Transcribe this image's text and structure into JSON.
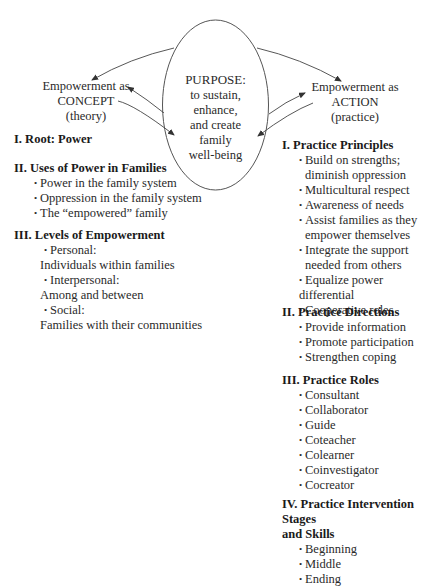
{
  "diagram": {
    "purpose": {
      "title": "PURPOSE:",
      "lines": [
        "to sustain,",
        "enhance,",
        "and create",
        "family",
        "well-being"
      ]
    },
    "concept": {
      "lines": [
        "Empowerment as",
        "CONCEPT",
        "(theory)"
      ]
    },
    "action": {
      "lines": [
        "Empowerment as",
        "ACTION",
        "(practice)"
      ]
    }
  },
  "left_column": {
    "sections": [
      {
        "heading": "I. Root: Power",
        "items": []
      },
      {
        "heading": "II. Uses of Power in Families",
        "items": [
          {
            "text": "Power in the family system"
          },
          {
            "text": "Oppression in the family system"
          },
          {
            "text": "The “empowered” family"
          }
        ]
      },
      {
        "heading": "III. Levels of Empowerment",
        "items": [
          {
            "text": "Personal:",
            "sub": "Individuals within families"
          },
          {
            "text": "Interpersonal:",
            "sub": "Among and between"
          },
          {
            "text": "Social:",
            "sub": "Families with their communities"
          }
        ]
      }
    ]
  },
  "right_column": {
    "sections": [
      {
        "heading": "I. Practice Principles",
        "items": [
          {
            "text": "Build on strengths;",
            "sub": "diminish oppression"
          },
          {
            "text": "Multicultural respect"
          },
          {
            "text": "Awareness of needs"
          },
          {
            "text": "Assist families as they",
            "sub": "empower themselves"
          },
          {
            "text": "Integrate the support",
            "sub": "needed from others"
          },
          {
            "text": "Equalize power differential"
          },
          {
            "text": "Cooperative roles"
          }
        ]
      },
      {
        "heading": "II. Practice Directions",
        "items": [
          {
            "text": "Provide information"
          },
          {
            "text": "Promote participation"
          },
          {
            "text": "Strengthen coping"
          }
        ]
      },
      {
        "heading": "III. Practice Roles",
        "items": [
          {
            "text": "Consultant"
          },
          {
            "text": "Collaborator"
          },
          {
            "text": "Guide"
          },
          {
            "text": "Coteacher"
          },
          {
            "text": "Colearner"
          },
          {
            "text": "Coinvestigator"
          },
          {
            "text": "Cocreator"
          }
        ]
      },
      {
        "heading": "IV. Practice Intervention Stages",
        "heading2": "and Skills",
        "items": [
          {
            "text": "Beginning"
          },
          {
            "text": "Middle"
          },
          {
            "text": "Ending"
          }
        ]
      }
    ]
  },
  "bullet_glyph": "•"
}
